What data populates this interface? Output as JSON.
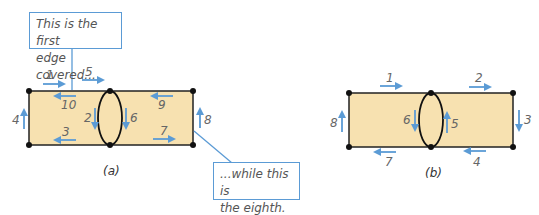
{
  "colors": {
    "fill": "#f7e1b0",
    "edge": "#222222",
    "arrow": "#5b9bd5",
    "callout_border": "#5b9bd5",
    "label": "#666666"
  },
  "diagram_a": {
    "caption": "(a)",
    "callout_first": "This is the first edge covered...",
    "callout_first_lines": [
      "This is the first",
      "edge covered..."
    ],
    "callout_eighth": "...while this is the eighth.",
    "callout_eighth_lines": [
      "...while this is",
      "the eighth."
    ],
    "edge_labels": [
      "1",
      "2",
      "3",
      "4",
      "5",
      "6",
      "7",
      "8",
      "9",
      "10"
    ]
  },
  "diagram_b": {
    "caption": "(b)",
    "edge_labels": [
      "1",
      "2",
      "3",
      "4",
      "5",
      "6",
      "7",
      "8"
    ]
  }
}
